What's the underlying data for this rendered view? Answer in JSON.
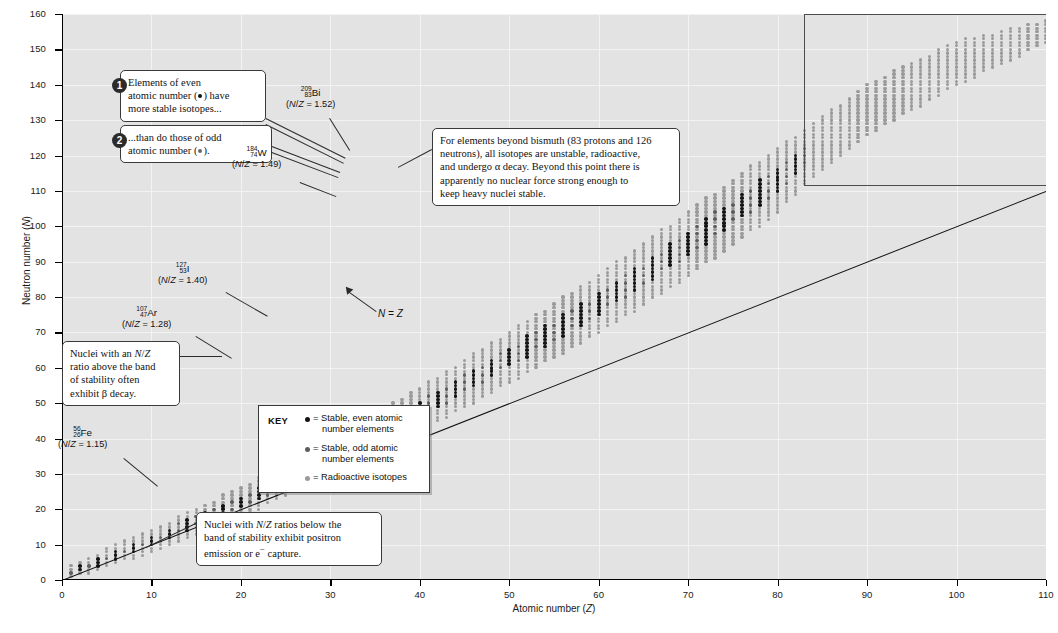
{
  "axes": {
    "xlabel_pre": "Atomic number (",
    "xlabel_var": "Z",
    "xlabel_post": ")",
    "ylabel_pre": "Neutron number (",
    "ylabel_var": "N",
    "ylabel_post": ")",
    "xticks": [
      "0",
      "10",
      "20",
      "30",
      "40",
      "50",
      "60",
      "70",
      "80",
      "90",
      "100",
      "110"
    ],
    "yticks": [
      "0",
      "10",
      "20",
      "30",
      "40",
      "50",
      "60",
      "70",
      "80",
      "90",
      "100",
      "110",
      "120",
      "130",
      "140",
      "150",
      "160"
    ]
  },
  "chart_data": {
    "type": "scatter",
    "title": "Band of stability",
    "xlabel": "Atomic number (Z)",
    "ylabel": "Neutron number (N)",
    "xlim": [
      0,
      110
    ],
    "ylim": [
      0,
      160
    ],
    "xtick_step": 10,
    "ytick_step": 10,
    "grid": true,
    "legend_position": "inside-center-lower",
    "series": [
      {
        "name": "Radioactive isotopes",
        "color": "#9a9a9a",
        "marker": "small-filled-circle"
      },
      {
        "name": "Stable, even atomic number elements",
        "color": "#141414",
        "marker": "filled-circle"
      },
      {
        "name": "Stable, odd atomic number elements",
        "color": "#5d5d5d",
        "marker": "filled-circle"
      }
    ],
    "reference_line": {
      "name": "N = Z",
      "equation": "N = Z",
      "from": [
        0,
        0
      ],
      "to": [
        110,
        110
      ]
    },
    "band_of_stability_envelope": {
      "lower_N_at_Z": [
        [
          0,
          0
        ],
        [
          10,
          8
        ],
        [
          20,
          18
        ],
        [
          30,
          30
        ],
        [
          40,
          42
        ],
        [
          50,
          56
        ],
        [
          60,
          70
        ],
        [
          70,
          86
        ],
        [
          80,
          104
        ],
        [
          83,
          112
        ],
        [
          90,
          126
        ],
        [
          100,
          140
        ],
        [
          110,
          152
        ]
      ],
      "upper_N_at_Z": [
        [
          0,
          3
        ],
        [
          10,
          14
        ],
        [
          20,
          26
        ],
        [
          30,
          40
        ],
        [
          40,
          54
        ],
        [
          50,
          70
        ],
        [
          60,
          86
        ],
        [
          70,
          104
        ],
        [
          80,
          122
        ],
        [
          83,
          127
        ],
        [
          90,
          140
        ],
        [
          100,
          152
        ],
        [
          110,
          158
        ]
      ]
    },
    "annotated_points": [
      {
        "symbol": "Fe",
        "mass": "56",
        "z": "26",
        "ratio": "1.15",
        "x": 26,
        "y": 30
      },
      {
        "symbol": "Ar",
        "mass": "107",
        "z": "47",
        "ratio": "1.28",
        "x": 47,
        "y": 60
      },
      {
        "symbol": "I",
        "mass": "127",
        "z": "53",
        "ratio": "1.40",
        "x": 53,
        "y": 74
      },
      {
        "symbol": "W",
        "mass": "184",
        "z": "74",
        "ratio": "1.49",
        "x": 74,
        "y": 110
      },
      {
        "symbol": "Bi",
        "mass": "209",
        "z": "83",
        "ratio": "1.52",
        "x": 83,
        "y": 126
      }
    ]
  },
  "isotope_labels": [
    {
      "name": "bismuth",
      "mass": "209",
      "z": "83",
      "symbol": "Bi",
      "ratio_pre": "(",
      "ratio_var1": "N",
      "ratio_slash": "/",
      "ratio_var2": "Z",
      "ratio_post": " = 1.52)"
    },
    {
      "name": "tungsten",
      "mass": "184",
      "z": "74",
      "symbol": "W",
      "ratio_pre": "(",
      "ratio_var1": "N",
      "ratio_slash": "/",
      "ratio_var2": "Z",
      "ratio_post": " = 1.49)"
    },
    {
      "name": "iodine",
      "mass": "127",
      "z": "53",
      "symbol": "I",
      "ratio_pre": "(",
      "ratio_var1": "N",
      "ratio_slash": "/",
      "ratio_var2": "Z",
      "ratio_post": " = 1.40)"
    },
    {
      "name": "silver",
      "mass": "107",
      "z": "47",
      "symbol": "Ar",
      "ratio_pre": "(",
      "ratio_var1": "N",
      "ratio_slash": "/",
      "ratio_var2": "Z",
      "ratio_post": " = 1.28)"
    },
    {
      "name": "iron",
      "mass": "56",
      "z": "26",
      "symbol": "Fe",
      "ratio_pre": "(",
      "ratio_var1": "N",
      "ratio_slash": "/",
      "ratio_var2": "Z",
      "ratio_post": " = 1.15)"
    }
  ],
  "callouts": {
    "even": {
      "badge": "1",
      "line1": "Elements of even",
      "line2_a": "atomic number (",
      "line2_b": ") have",
      "line3": "more stable isotopes..."
    },
    "odd": {
      "badge": "2",
      "line1": "...than do those of odd",
      "line2_a": "atomic number (",
      "line2_b": ")."
    },
    "bismuth": {
      "line1": "For elements beyond bismuth (83 protons and 126",
      "line2": "neutrons), all isotopes are unstable, radioactive,",
      "line3": "and undergo α decay.  Beyond this point there is",
      "line4": "apparently no nuclear force strong enough to",
      "line5": "keep heavy nuclei stable."
    },
    "beta": {
      "line1_a": "Nuclei with an ",
      "line1_b": "N",
      "line1_c": "/",
      "line1_d": "Z",
      "line2": "ratio above the band",
      "line3": "of stability often",
      "line4": "exhibit β decay."
    },
    "positron": {
      "line1_a": "Nuclei with ",
      "line1_b": "N",
      "line1_c": "/",
      "line1_d": "Z",
      "line1_e": " ratios below the",
      "line2": "band of stability exhibit positron",
      "line3_a": "emission or e",
      "line3_sup": "−",
      "line3_b": " capture."
    }
  },
  "nz_annotation": {
    "var1": "N",
    "equals": " = ",
    "var2": "Z"
  },
  "key": {
    "title": "KEY",
    "rows": [
      {
        "marker": "even",
        "eq": "= Stable, even atomic",
        "line2": "number elements"
      },
      {
        "marker": "odd",
        "eq": "= Stable, odd atomic",
        "line2": "number elements"
      },
      {
        "marker": "radio",
        "eq": "= Radioactive isotopes",
        "line2": ""
      }
    ]
  },
  "colors": {
    "plot_background": "#e3e3e3",
    "gridline": "#f3f3f3",
    "stable_even": "#141414",
    "stable_odd": "#5d5d5d",
    "radioactive": "#9a9a9a",
    "axis": "#000000"
  }
}
